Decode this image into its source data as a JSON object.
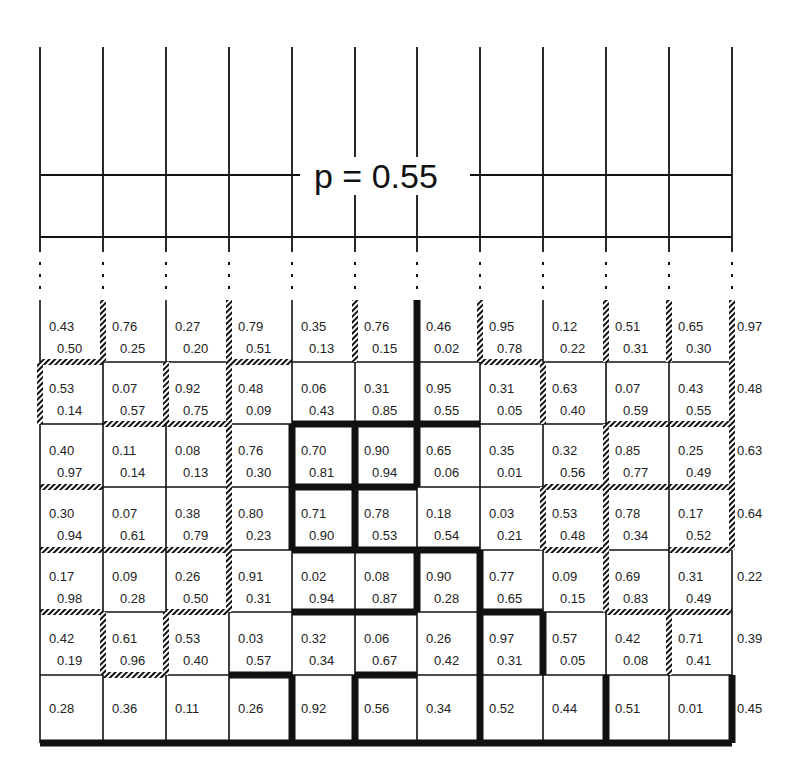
{
  "figure": {
    "label": "p = 0.55",
    "colors": {
      "line": "#111111",
      "background": "#ffffff",
      "text": "#222222"
    },
    "line_styles": {
      "thin": "thin solid line",
      "hatch": "hatched line",
      "thick": "thick solid line"
    },
    "upper_grid": {
      "columns": 11,
      "rows": 2,
      "note": "open-top lattice continuing upward; dotted continuation marks between upper and lower grids"
    },
    "lower_grid": {
      "columns": 11,
      "rows": 7,
      "cells": [
        [
          [
            "0.43",
            "0.50"
          ],
          [
            "0.76",
            "0.25"
          ],
          [
            "0.27",
            "0.20"
          ],
          [
            "0.79",
            "0.51"
          ],
          [
            "0.35",
            "0.13"
          ],
          [
            "0.76",
            "0.15"
          ],
          [
            "0.46",
            "0.02"
          ],
          [
            "0.95",
            "0.78"
          ],
          [
            "0.12",
            "0.22"
          ],
          [
            "0.51",
            "0.31"
          ],
          [
            "0.65",
            "0.30"
          ]
        ],
        [
          [
            "0.53",
            "0.14"
          ],
          [
            "0.07",
            "0.57"
          ],
          [
            "0.92",
            "0.75"
          ],
          [
            "0.48",
            "0.09"
          ],
          [
            "0.06",
            "0.43"
          ],
          [
            "0.31",
            "0.85"
          ],
          [
            "0.95",
            "0.55"
          ],
          [
            "0.31",
            "0.05"
          ],
          [
            "0.63",
            "0.40"
          ],
          [
            "0.07",
            "0.59"
          ],
          [
            "0.43",
            "0.55"
          ]
        ],
        [
          [
            "0.40",
            "0.97"
          ],
          [
            "0.11",
            "0.14"
          ],
          [
            "0.08",
            "0.13"
          ],
          [
            "0.76",
            "0.30"
          ],
          [
            "0.70",
            "0.81"
          ],
          [
            "0.90",
            "0.94"
          ],
          [
            "0.65",
            "0.06"
          ],
          [
            "0.35",
            "0.01"
          ],
          [
            "0.32",
            "0.56"
          ],
          [
            "0.85",
            "0.77"
          ],
          [
            "0.25",
            "0.49"
          ]
        ],
        [
          [
            "0.30",
            "0.94"
          ],
          [
            "0.07",
            "0.61"
          ],
          [
            "0.38",
            "0.79"
          ],
          [
            "0.80",
            "0.23"
          ],
          [
            "0.71",
            "0.90"
          ],
          [
            "0.78",
            "0.53"
          ],
          [
            "0.18",
            "0.54"
          ],
          [
            "0.03",
            "0.21"
          ],
          [
            "0.53",
            "0.48"
          ],
          [
            "0.78",
            "0.34"
          ],
          [
            "0.17",
            "0.52"
          ]
        ],
        [
          [
            "0.17",
            "0.98"
          ],
          [
            "0.09",
            "0.28"
          ],
          [
            "0.26",
            "0.50"
          ],
          [
            "0.91",
            "0.31"
          ],
          [
            "0.02",
            "0.94"
          ],
          [
            "0.08",
            "0.87"
          ],
          [
            "0.90",
            "0.28"
          ],
          [
            "0.77",
            "0.65"
          ],
          [
            "0.09",
            "0.15"
          ],
          [
            "0.69",
            "0.83"
          ],
          [
            "0.31",
            "0.49"
          ]
        ],
        [
          [
            "0.42",
            "0.19"
          ],
          [
            "0.61",
            "0.96"
          ],
          [
            "0.53",
            "0.40"
          ],
          [
            "0.03",
            "0.57"
          ],
          [
            "0.32",
            "0.34"
          ],
          [
            "0.06",
            "0.67"
          ],
          [
            "0.26",
            "0.42"
          ],
          [
            "0.97",
            "0.31"
          ],
          [
            "0.57",
            "0.05"
          ],
          [
            "0.42",
            "0.08"
          ],
          [
            "0.71",
            "0.41"
          ]
        ],
        [
          [
            "0.28"
          ],
          [
            "0.36"
          ],
          [
            "0.11"
          ],
          [
            "0.26"
          ],
          [
            "0.92"
          ],
          [
            "0.56"
          ],
          [
            "0.34"
          ],
          [
            "0.52"
          ],
          [
            "0.44"
          ],
          [
            "0.51"
          ],
          [
            "0.01"
          ]
        ]
      ],
      "right_values": [
        "0.97",
        "0.48",
        "0.63",
        "0.64",
        "0.22",
        "0.39",
        "0.45"
      ],
      "vertical_edges": [
        [
          "thin",
          "hatch",
          "thin",
          "hatch",
          "thin",
          "hatch",
          "thick",
          "hatch",
          "thin",
          "hatch",
          "hatch",
          "hatch"
        ],
        [
          "hatch",
          "thin",
          "hatch",
          "hatch",
          "thin",
          "thin",
          "thick",
          "thin",
          "hatch",
          "thin",
          "thin",
          "hatch"
        ],
        [
          "thin",
          "thin",
          "thin",
          "hatch",
          "thick",
          "thick",
          "thick",
          "thin",
          "thin",
          "hatch",
          "thin",
          "hatch"
        ],
        [
          "thin",
          "thin",
          "thin",
          "hatch",
          "thick",
          "thick",
          "thin",
          "thin",
          "hatch",
          "hatch",
          "thin",
          "hatch"
        ],
        [
          "thin",
          "thin",
          "thin",
          "hatch",
          "thin",
          "thin",
          "thick",
          "thick",
          "thin",
          "hatch",
          "thin",
          "thin"
        ],
        [
          "thin",
          "hatch",
          "hatch",
          "thin",
          "thin",
          "thin",
          "thin",
          "thick",
          "thick",
          "thin",
          "hatch",
          "thin"
        ],
        [
          "thin",
          "thin",
          "thin",
          "thin",
          "thick",
          "thick",
          "thin",
          "thick",
          "thin",
          "thick",
          "thin",
          "thick"
        ]
      ],
      "horizontal_edges": [
        [
          "hatch",
          "thin",
          "thin",
          "hatch",
          "thin",
          "thin",
          "thin",
          "hatch",
          "thin",
          "thin",
          "thin"
        ],
        [
          "thin",
          "hatch",
          "hatch",
          "thin",
          "thick",
          "thick",
          "thick",
          "thin",
          "thin",
          "hatch",
          "hatch"
        ],
        [
          "hatch",
          "thin",
          "thin",
          "thin",
          "thick",
          "thick",
          "thin",
          "thin",
          "hatch",
          "hatch",
          "hatch"
        ],
        [
          "hatch",
          "hatch",
          "hatch",
          "thin",
          "thick",
          "thick",
          "thick",
          "thin",
          "hatch",
          "thin",
          "hatch"
        ],
        [
          "hatch",
          "thin",
          "hatch",
          "thin",
          "thick",
          "thick",
          "thin",
          "thick",
          "thin",
          "hatch",
          "hatch"
        ],
        [
          "thin",
          "hatch",
          "thin",
          "thick",
          "thin",
          "thick",
          "thin",
          "thin",
          "thin",
          "thin",
          "thin"
        ],
        [
          "thick",
          "thick",
          "thick",
          "thick",
          "thick",
          "thick",
          "thick",
          "thick",
          "thick",
          "thick",
          "thick"
        ]
      ]
    }
  }
}
